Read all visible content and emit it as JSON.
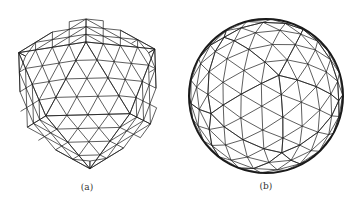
{
  "figure": {
    "panels": [
      {
        "id": "a",
        "caption": "(a)",
        "shape": "icosahedron",
        "subdivision": 4,
        "center": [
          88,
          90
        ],
        "radius": 80,
        "caption_pos": [
          87,
          189
        ],
        "stroke_color": "#1a1a1a",
        "outline_width": 0.8
      },
      {
        "id": "b",
        "caption": "(b)",
        "shape": "geodesic-sphere",
        "subdivision": 4,
        "center": [
          266,
          96
        ],
        "radius": 77,
        "caption_pos": [
          266,
          188
        ],
        "stroke_color": "#1a1a1a",
        "outline_width": 2
      }
    ]
  }
}
